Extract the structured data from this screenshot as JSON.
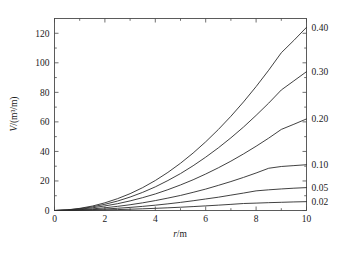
{
  "chart_data": {
    "type": "line",
    "title": "",
    "subtitle": "",
    "xlabel": "r/m",
    "xlabel_symbol": "r",
    "xlabel_unit": "/m",
    "ylabel": "V/(m³/m)",
    "ylabel_symbol": "V",
    "ylabel_unit": "/(m³/m)",
    "xlim": [
      0,
      10
    ],
    "ylim": [
      0,
      130
    ],
    "xticks": [
      0,
      2,
      4,
      6,
      8,
      10
    ],
    "xtick_labels": [
      "0",
      "2",
      "4",
      "6",
      "8",
      "10"
    ],
    "xminor_ticks": [
      1,
      3,
      5,
      7,
      9
    ],
    "yticks": [
      0,
      20,
      40,
      60,
      80,
      100,
      120
    ],
    "ytick_labels": [
      "0",
      "20",
      "40",
      "60",
      "80",
      "100",
      "120"
    ],
    "yminor_ticks": [
      10,
      30,
      50,
      70,
      90,
      110
    ],
    "grid": false,
    "legend_position": "right-axis-end-labels",
    "x": [
      0,
      0.5,
      1,
      1.5,
      2,
      2.5,
      3,
      3.5,
      4,
      4.5,
      5,
      5.5,
      6,
      6.5,
      7,
      7.5,
      8,
      8.5,
      9,
      9.5,
      10
    ],
    "series": [
      {
        "name": "0.40",
        "label": "0.40",
        "end_value": 124,
        "values": [
          0,
          0.42,
          1.45,
          3.0,
          5.2,
          8.0,
          11.4,
          15.5,
          20.3,
          25.8,
          32.0,
          38.9,
          46.5,
          54.8,
          63.8,
          73.5,
          83.9,
          95.0,
          106.8,
          115.2,
          124.0
        ]
      },
      {
        "name": "0.30",
        "label": "0.30",
        "end_value": 94,
        "values": [
          0,
          0.35,
          1.2,
          2.45,
          4.2,
          6.4,
          9.1,
          12.3,
          16.0,
          20.3,
          25.0,
          30.3,
          36.1,
          42.4,
          49.2,
          56.5,
          64.4,
          72.7,
          81.6,
          87.8,
          94.0
        ]
      },
      {
        "name": "0.20",
        "label": "0.20",
        "end_value": 62,
        "values": [
          0,
          0.26,
          0.9,
          1.8,
          3.1,
          4.6,
          6.5,
          8.7,
          11.2,
          14.1,
          17.3,
          20.8,
          24.7,
          28.9,
          33.4,
          38.3,
          43.5,
          49.0,
          54.9,
          58.4,
          62.0
        ]
      },
      {
        "name": "0.10",
        "label": "0.10",
        "end_value": 31,
        "values": [
          0,
          0.15,
          0.55,
          1.1,
          1.85,
          2.8,
          3.9,
          5.2,
          6.7,
          8.4,
          10.2,
          12.3,
          14.5,
          17.0,
          19.6,
          22.4,
          25.4,
          28.6,
          29.8,
          30.4,
          31.0
        ]
      },
      {
        "name": "0.05",
        "label": "0.05",
        "end_value": 15.5,
        "values": [
          0,
          0.08,
          0.3,
          0.6,
          1.0,
          1.5,
          2.1,
          2.8,
          3.6,
          4.5,
          5.5,
          6.6,
          7.8,
          9.0,
          10.4,
          11.8,
          13.3,
          14.0,
          14.6,
          15.1,
          15.5
        ]
      },
      {
        "name": "0.02",
        "label": "0.02",
        "end_value": 6.0,
        "values": [
          0,
          0.03,
          0.12,
          0.25,
          0.42,
          0.62,
          0.87,
          1.15,
          1.47,
          1.83,
          2.22,
          2.65,
          3.12,
          3.62,
          4.16,
          4.73,
          5.0,
          5.3,
          5.55,
          5.8,
          6.0
        ]
      }
    ]
  }
}
